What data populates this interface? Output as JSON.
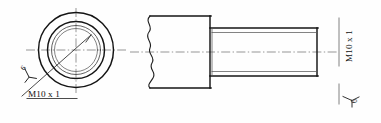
{
  "drawing": {
    "title": "Threaded Stud Mechanical Part Drawing",
    "background_color": "#fefefe",
    "line_color": "#141414",
    "centerline_color": "#6b6b6b",
    "thin_line_color": "#5a5a5a"
  },
  "front_view": {
    "name": "end-view-circles",
    "center_x": 76,
    "center_y": 50,
    "circles": [
      {
        "name": "outer-boss-circle",
        "r": 37.5,
        "weight": "thick"
      },
      {
        "name": "thread-major-circle",
        "r": 28.5,
        "weight": "thick"
      },
      {
        "name": "thread-minor-circle",
        "r": 24.5,
        "weight": "thin"
      },
      {
        "name": "inner-bore-circle",
        "r": 21.5,
        "weight": "thin"
      }
    ],
    "centerline_h": {
      "x1": 26,
      "x2": 126,
      "y": 50
    },
    "centerline_v": {
      "y1": 8,
      "y2": 94,
      "x": 76
    }
  },
  "side_view": {
    "name": "side-section-view",
    "body": {
      "x": 147,
      "y": 16,
      "width": 63,
      "height": 72
    },
    "shaft": {
      "x": 210,
      "y": 28,
      "width": 108,
      "height": 48
    },
    "shaft_minor_inset": 4,
    "break_line_x": 150,
    "centerline_y": 52,
    "centerline_x1": 130,
    "centerline_x2": 335
  },
  "labels": {
    "thread_left": "M10 x 1",
    "thread_right": "M10 x 1",
    "roughness_left": "6",
    "roughness_right": "6"
  },
  "annotations": {
    "leader_left": {
      "name": "thread-leader-line",
      "from_x": 88,
      "from_y": 38,
      "to_x": 22,
      "to_y": 96
    },
    "underline_left": {
      "x1": 27,
      "x2": 76,
      "y": 98
    },
    "extension_right": {
      "x": 340,
      "y1": 20,
      "y2": 100
    }
  }
}
